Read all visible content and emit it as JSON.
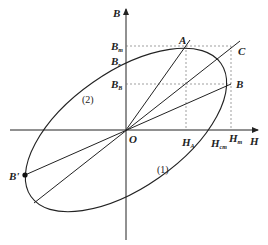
{
  "diagram": {
    "axes": {
      "x_label": "H",
      "y_label": "B",
      "origin_label": "O"
    },
    "points": {
      "A": "A",
      "B": "B",
      "C": "C",
      "B_prime": "B'"
    },
    "y_ticks": {
      "Bm": {
        "main": "B",
        "sub": "m"
      },
      "Br": {
        "main": "B",
        "sub": "r"
      },
      "Bb": {
        "main": "B",
        "sub": "B"
      }
    },
    "x_ticks": {
      "HA": {
        "main": "H",
        "sub": "A"
      },
      "Hcm": {
        "main": "H",
        "sub": "cm"
      },
      "Hm": {
        "main": "H",
        "sub": "m"
      }
    },
    "regions": {
      "region1": "(1)",
      "region2": "(2)"
    },
    "colors": {
      "stroke": "#222222",
      "dashed": "#777777",
      "background": "#ffffff"
    }
  }
}
